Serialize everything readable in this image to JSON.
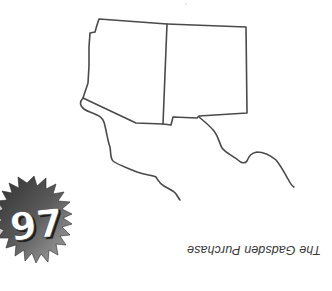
{
  "page": {
    "caption": "The Gadsden Purchase",
    "caption_orientation": "upside-down",
    "badge": {
      "number": "97",
      "shape": "starburst",
      "colors": {
        "dark": "#3c3c3c",
        "light": "#9a9a9a",
        "text": "#ffffff"
      }
    },
    "map": {
      "subject": "Outline map of Arizona and New Mexico with Mexican border region",
      "stroke_color": "#4a4a4a",
      "regions": [
        "arizona-outline",
        "new-mexico-outline",
        "west-border-line",
        "east-border-line"
      ]
    }
  }
}
